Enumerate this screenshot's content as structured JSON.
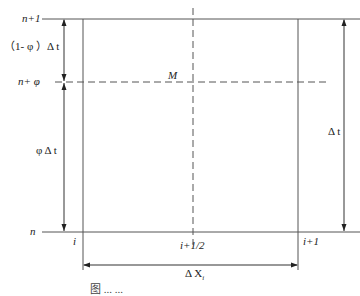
{
  "diagram": {
    "type": "finite-difference grid cell",
    "time_levels": {
      "top": "n+1",
      "middle": "n+ φ",
      "bottom": "n"
    },
    "space_nodes": {
      "left": "i",
      "center": "i+1/2",
      "right": "i+1"
    },
    "center_point": "M",
    "dimensions": {
      "upper_interval": "（1- φ ）Δ t",
      "lower_interval": "φ Δ t",
      "total_time": "Δ t",
      "space_step": "Δ X"
    },
    "space_step_subscript": "i",
    "caption": "图 ... ..."
  }
}
